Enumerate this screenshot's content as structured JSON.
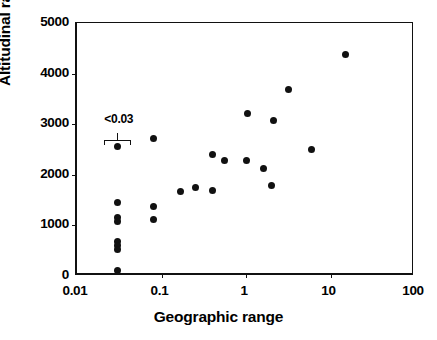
{
  "chart_data": {
    "type": "scatter",
    "title": "",
    "xlabel": "Geographic range",
    "ylabel": "Altitudinal range",
    "xscale": "log",
    "yscale": "linear",
    "xlim": [
      0.01,
      100
    ],
    "ylim": [
      0,
      5000
    ],
    "xticks": [
      0.01,
      0.1,
      1,
      10,
      100
    ],
    "xticklabels": [
      "0.01",
      "0.1",
      "1",
      "10",
      "100"
    ],
    "yticks": [
      0,
      1000,
      2000,
      3000,
      4000,
      5000
    ],
    "yticklabels": [
      "0",
      "1000",
      "2000",
      "3000",
      "4000",
      "5000"
    ],
    "grid": false,
    "legend": null,
    "marker": "filled-circle",
    "marker_color": "#111111",
    "annotations": [
      {
        "text": "<0.03",
        "x": 0.03,
        "y": 3000,
        "note": "bracket below label spans the left censored column of points at x<0.03"
      }
    ],
    "points": [
      {
        "x": 0.03,
        "y": 2560
      },
      {
        "x": 0.03,
        "y": 1450
      },
      {
        "x": 0.03,
        "y": 1160
      },
      {
        "x": 0.03,
        "y": 1080
      },
      {
        "x": 0.03,
        "y": 680
      },
      {
        "x": 0.03,
        "y": 600
      },
      {
        "x": 0.03,
        "y": 520
      },
      {
        "x": 0.03,
        "y": 100
      },
      {
        "x": 0.08,
        "y": 2710
      },
      {
        "x": 0.08,
        "y": 1380
      },
      {
        "x": 0.08,
        "y": 1110
      },
      {
        "x": 0.17,
        "y": 1670
      },
      {
        "x": 0.25,
        "y": 1740
      },
      {
        "x": 0.4,
        "y": 2400
      },
      {
        "x": 0.4,
        "y": 1690
      },
      {
        "x": 0.55,
        "y": 2280
      },
      {
        "x": 1.05,
        "y": 3210
      },
      {
        "x": 1.0,
        "y": 2290
      },
      {
        "x": 1.6,
        "y": 2120
      },
      {
        "x": 2.1,
        "y": 3080
      },
      {
        "x": 2.0,
        "y": 1790
      },
      {
        "x": 3.2,
        "y": 3690
      },
      {
        "x": 6.0,
        "y": 2500
      },
      {
        "x": 15.0,
        "y": 4380
      }
    ]
  },
  "figure": {
    "background_color": "#ffffff",
    "axis_color": "#111111"
  }
}
